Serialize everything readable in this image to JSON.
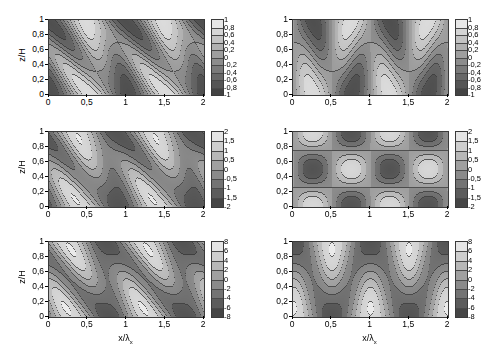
{
  "figure": {
    "title": "",
    "layout": "3 rows x 2 columns of filled contour plots",
    "colormap": "grayscale",
    "rows": 3,
    "cols": 2
  },
  "axes": {
    "xlabel": "x/λ",
    "xlabel_sub": "x",
    "ylabel": "z/H",
    "xticks": [
      "0",
      "0,5",
      "1",
      "1,5",
      "2"
    ],
    "xtick_values": [
      0,
      0.5,
      1,
      1.5,
      2
    ],
    "yticks": [
      "0",
      "0,2",
      "0,4",
      "0,6",
      "0,8",
      "1"
    ],
    "ytick_values": [
      0,
      0.2,
      0.4,
      0.6,
      0.8,
      1
    ],
    "xlim": [
      0,
      2
    ],
    "ylim": [
      0,
      1
    ]
  },
  "chart_data": [
    {
      "id": "panel-top-left",
      "type": "heatmap",
      "row": 0,
      "col": 0,
      "title": "",
      "xlabel": "",
      "ylabel": "z/H",
      "xlim": [
        0,
        2
      ],
      "ylim": [
        0,
        1
      ],
      "grid": false,
      "colorbar": {
        "ticks": [
          "1",
          "0,8",
          "0,6",
          "0,4",
          "0,2",
          "0",
          "-0,2",
          "-0,4",
          "-0,6",
          "-0,8",
          "-1"
        ],
        "tick_values": [
          1,
          0.8,
          0.6,
          0.4,
          0.2,
          0,
          -0.2,
          -0.4,
          -0.6,
          -0.8,
          -1
        ],
        "vmin": -1,
        "vmax": 1,
        "step": 0.2,
        "levels": 10
      },
      "pattern": "sheared",
      "shear": 0.55,
      "kx": 2,
      "kz": 1,
      "phase": 0.0,
      "amplitude": 1,
      "description": "Tilted periodic cellular contour field, 4 wavelengths across x, maxima and minima slanted with height"
    },
    {
      "id": "panel-top-right",
      "type": "heatmap",
      "row": 0,
      "col": 1,
      "title": "",
      "xlabel": "",
      "ylabel": "",
      "xlim": [
        0,
        2
      ],
      "ylim": [
        0,
        1
      ],
      "grid": false,
      "colorbar": {
        "ticks": [
          "1",
          "0,8",
          "0,6",
          "0,4",
          "0,2",
          "0",
          "-0,2",
          "-0,4",
          "-0,6",
          "-0,8",
          "-1"
        ],
        "tick_values": [
          1,
          0.8,
          0.6,
          0.4,
          0.2,
          0,
          -0.2,
          -0.4,
          -0.6,
          -0.8,
          -1
        ],
        "vmin": -1,
        "vmax": 1,
        "step": 0.2,
        "levels": 10
      },
      "pattern": "symmetric",
      "shear": 0.0,
      "kx": 2,
      "kz": 1,
      "phase": 0.0,
      "amplitude": 1,
      "description": "Upright symmetric cellular contour field, vertical lobes at top and bottom boundaries"
    },
    {
      "id": "panel-mid-left",
      "type": "heatmap",
      "row": 1,
      "col": 0,
      "title": "",
      "xlabel": "",
      "ylabel": "z/H",
      "xlim": [
        0,
        2
      ],
      "ylim": [
        0,
        1
      ],
      "grid": false,
      "colorbar": {
        "ticks": [
          "2",
          "1,5",
          "1",
          "0,5",
          "0",
          "-0,5",
          "-1",
          "-1,5",
          "-2"
        ],
        "tick_values": [
          2,
          1.5,
          1,
          0.5,
          0,
          -0.5,
          -1,
          -1.5,
          -2
        ],
        "vmin": -2,
        "vmax": 2,
        "step": 0.5,
        "levels": 8
      },
      "pattern": "sheared",
      "shear": 0.55,
      "kx": 2,
      "kz": 1,
      "phase": 0.25,
      "amplitude": 2,
      "description": "Tilted field with narrow lobes touching upper and lower boundaries, stronger amplitude"
    },
    {
      "id": "panel-mid-right",
      "type": "heatmap",
      "row": 1,
      "col": 1,
      "title": "",
      "xlabel": "",
      "ylabel": "",
      "xlim": [
        0,
        2
      ],
      "ylim": [
        0,
        1
      ],
      "grid": false,
      "colorbar": {
        "ticks": [
          "2",
          "1,5",
          "1",
          "0,5",
          "0",
          "-0,5",
          "-1",
          "-1,5",
          "-2"
        ],
        "tick_values": [
          2,
          1.5,
          1,
          0.5,
          0,
          -0.5,
          -1,
          -1.5,
          -2
        ],
        "vmin": -2,
        "vmax": 2,
        "step": 0.5,
        "levels": 8
      },
      "pattern": "symmetric-nodal",
      "shear": 0.0,
      "kx": 2,
      "kz": 1,
      "phase": 0.25,
      "amplitude": 2,
      "nodal_lines": {
        "horizontal": [
          0.5
        ],
        "vertical": [
          0.25,
          0.75,
          1.25,
          1.75
        ]
      },
      "description": "Upright mode with a straight horizontal nodal line at z/H = 0,5 and straight vertical nodal lines"
    },
    {
      "id": "panel-bot-left",
      "type": "heatmap",
      "row": 2,
      "col": 0,
      "title": "",
      "xlabel": "x/λx",
      "ylabel": "z/H",
      "xlim": [
        0,
        2
      ],
      "ylim": [
        0,
        1
      ],
      "grid": false,
      "colorbar": {
        "ticks": [
          "8",
          "6",
          "4",
          "2",
          "0",
          "-2",
          "-4",
          "-6",
          "-8"
        ],
        "tick_values": [
          8,
          6,
          4,
          2,
          0,
          -2,
          -4,
          -6,
          -8
        ],
        "vmin": -8,
        "vmax": 8,
        "step": 2,
        "levels": 8
      },
      "pattern": "sheared",
      "shear": 0.55,
      "kx": 2,
      "kz": 1,
      "phase": 0.5,
      "amplitude": 8,
      "description": "Tilted field, fewer contour levels, bright vertical bands between dark boundary lobes"
    },
    {
      "id": "panel-bot-right",
      "type": "heatmap",
      "row": 2,
      "col": 1,
      "title": "",
      "xlabel": "x/λx",
      "ylabel": "",
      "xlim": [
        0,
        2
      ],
      "ylim": [
        0,
        1
      ],
      "grid": false,
      "colorbar": {
        "ticks": [
          "8",
          "6",
          "4",
          "2",
          "0",
          "-2",
          "-4",
          "-6",
          "-8"
        ],
        "tick_values": [
          8,
          6,
          4,
          2,
          0,
          -2,
          -4,
          -6,
          -8
        ],
        "vmin": -8,
        "vmax": 8,
        "step": 2,
        "levels": 8
      },
      "pattern": "symmetric",
      "shear": 0.0,
      "kx": 2,
      "kz": 1,
      "phase": 0.5,
      "amplitude": 8,
      "description": "Upright symmetric field with broad bright columns centred near x/λx = 0,75 and 1,75"
    }
  ],
  "colors": {
    "background": "#ffffff",
    "axis": "#3a3a3a",
    "text": "#000000",
    "contour_line": "#4a4a4a",
    "cmap_low": "#4a4a4a",
    "cmap_mid": "#9a9a9a",
    "cmap_high": "#f0f0f0"
  }
}
